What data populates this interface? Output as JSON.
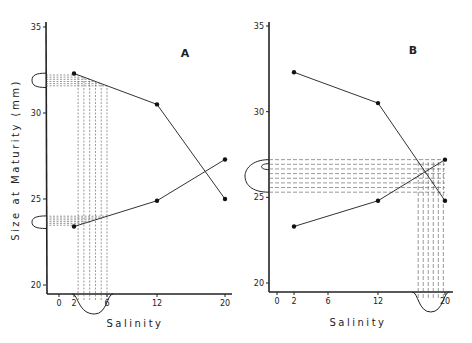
{
  "chart_data": [
    {
      "panel": "A",
      "type": "line",
      "title": "",
      "panel_label": "A",
      "xlabel": "Salinity",
      "ylabel": "Size at Maturity  (mm)",
      "xticks": [
        0,
        2,
        6,
        12,
        20
      ],
      "yticks": [
        20,
        25,
        30,
        35
      ],
      "ylim": [
        20,
        35
      ],
      "xlim": [
        0,
        20
      ],
      "grid": false,
      "series": [
        {
          "name": "decreasing",
          "x": [
            2,
            12,
            20
          ],
          "y": [
            32.3,
            30.5,
            25.0
          ]
        },
        {
          "name": "increasing",
          "x": [
            2,
            12,
            20
          ],
          "y": [
            23.4,
            24.9,
            27.3
          ]
        }
      ],
      "annotations": {
        "x_distribution": {
          "center": 4.5,
          "range": [
            2.5,
            6
          ],
          "note": "bell curve below x-axis with dashed projection lines"
        },
        "y_distributions": [
          {
            "center": 31.9,
            "range": [
              31.6,
              32.2
            ]
          },
          {
            "center": 23.6,
            "range": [
              23.4,
              23.9
            ]
          }
        ]
      }
    },
    {
      "panel": "B",
      "type": "line",
      "title": "",
      "panel_label": "B",
      "xlabel": "Salinity",
      "ylabel": "",
      "xticks": [
        0,
        2,
        6,
        12,
        20
      ],
      "yticks": [
        20,
        25,
        30,
        35
      ],
      "ylim": [
        20,
        35
      ],
      "xlim": [
        0,
        20
      ],
      "grid": false,
      "series": [
        {
          "name": "decreasing",
          "x": [
            2,
            12,
            20
          ],
          "y": [
            32.3,
            30.5,
            24.8
          ]
        },
        {
          "name": "increasing",
          "x": [
            2,
            12,
            20
          ],
          "y": [
            23.3,
            24.8,
            27.2
          ]
        }
      ],
      "annotations": {
        "x_distribution": {
          "center": 18.3,
          "range": [
            16.8,
            19.8
          ],
          "note": "bell curve below x-axis with dashed projection lines"
        },
        "y_distributions": [
          {
            "center": 26.4,
            "range": [
              25.3,
              27.2
            ]
          }
        ]
      }
    }
  ],
  "labels": {
    "panelA": "A",
    "panelB": "B",
    "ylabel": "Size at Maturity  (mm)",
    "xlabelA": "Salinity",
    "xlabelB": "Salinity",
    "ticksX": [
      "0",
      "2",
      "6",
      "12",
      "20"
    ],
    "ticksY": [
      "20",
      "25",
      "30",
      "35"
    ]
  }
}
